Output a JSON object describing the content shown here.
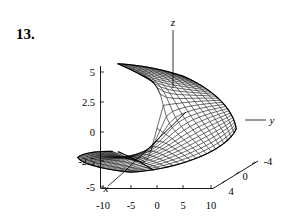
{
  "figure": {
    "problem_number": "13.",
    "caption": ""
  },
  "axes": {
    "z_axis_label": "z",
    "y_axis_label": "y",
    "x_axis_label": "x",
    "vertical_ticks": [
      "5",
      "2.5",
      "0",
      "-2.5",
      "-5"
    ],
    "horizontal_ticks": [
      "-10",
      "-5",
      "0",
      "5",
      "10"
    ],
    "depth_ticks": [
      "4",
      "0",
      "-4"
    ]
  },
  "style": {
    "background": "#ffffff",
    "ink": "#000000",
    "mesh_ink": "#111111"
  },
  "chart_data": {
    "type": "surface",
    "title": "",
    "subtitle": "",
    "xlabel": "x",
    "ylabel": "y",
    "zlabel": "z",
    "xlim": [
      -10,
      10
    ],
    "ylim": [
      -4,
      4
    ],
    "zlim": [
      -5,
      5
    ],
    "xticks": [
      -10,
      -5,
      0,
      5,
      10
    ],
    "yticks": [
      4,
      0,
      -4
    ],
    "zticks": [
      -5,
      -2.5,
      0,
      2.5,
      5
    ],
    "grid": false,
    "legend": "none",
    "mesh": {
      "u_divisions": 26,
      "v_divisions": 20,
      "wireframe": true,
      "hidden_line_removal": true
    },
    "projection": {
      "type": "axonometric",
      "x_axis_screen_vector": [
        0.62,
        0.4
      ],
      "y_axis_screen_vector": [
        1.0,
        -0.17
      ],
      "z_axis_screen_vector": [
        0.0,
        -1.0
      ]
    },
    "annotations": [
      {
        "text": "z",
        "position": "top",
        "kind": "axis-name"
      },
      {
        "text": "y",
        "position": "right",
        "kind": "axis-name"
      },
      {
        "text": "x",
        "position": "bottom-left",
        "kind": "axis-name"
      }
    ]
  }
}
